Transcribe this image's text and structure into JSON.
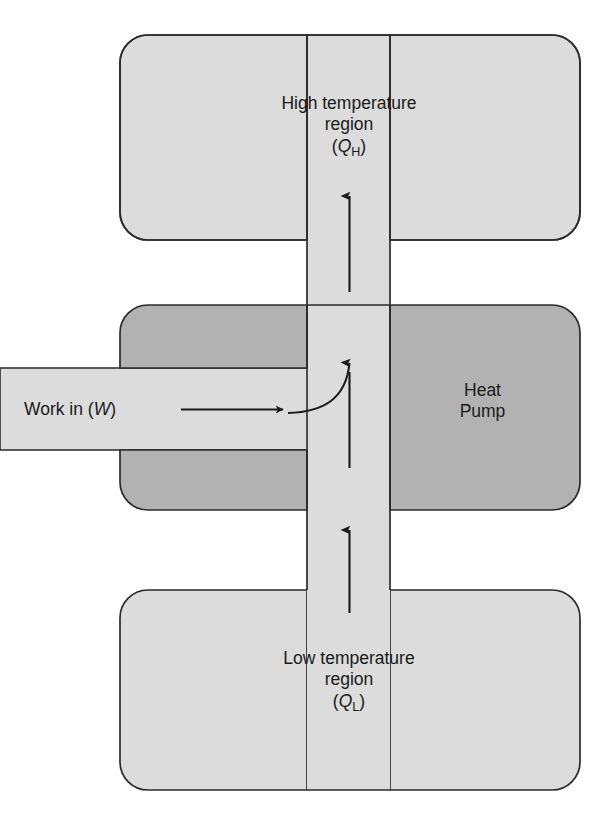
{
  "diagram": {
    "type": "thermodynamic-block-diagram",
    "colors": {
      "light_region_fill": "#dcdcdc",
      "dark_region_fill": "#b2b2b2",
      "channel_fill": "#dcdcdc",
      "outline": "#2b2b2b",
      "text": "#1a1a1a",
      "background": "#ffffff"
    },
    "regions": {
      "high_temperature": {
        "name": "high-temperature-region",
        "line1": "High temperature",
        "line2": "region",
        "line3_open": "(",
        "line3_symbol": "Q",
        "line3_subscript": "H",
        "line3_close": ")",
        "fill": "#dcdcdc"
      },
      "low_temperature": {
        "name": "low-temperature-region",
        "line1": "Low temperature",
        "line2": "region",
        "line3_open": "(",
        "line3_symbol": "Q",
        "line3_subscript": "L",
        "line3_close": ")",
        "fill": "#dcdcdc"
      },
      "heat_pump": {
        "name": "heat-pump-block",
        "line1": "Heat",
        "line2": "Pump",
        "fill": "#b2b2b2"
      },
      "work_input": {
        "name": "work-input-bar",
        "prefix": "Work in (",
        "symbol": "W",
        "suffix": ")",
        "fill": "#dcdcdc"
      }
    },
    "arrows": [
      {
        "name": "heat-out-arrow",
        "label": "Q_H out to high temperature region",
        "direction": "up"
      },
      {
        "name": "work-in-arrow",
        "label": "Work in W",
        "direction": "right"
      },
      {
        "name": "work-turn-arrow",
        "label": "Work converted to upward flow",
        "direction": "curve-up"
      },
      {
        "name": "heat-in-arrow",
        "label": "Q_L in from low temperature region",
        "direction": "up"
      }
    ]
  }
}
